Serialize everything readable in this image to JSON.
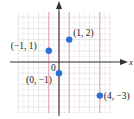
{
  "chart_data": {
    "type": "scatter",
    "title": "",
    "xlabel": "x",
    "ylabel": "",
    "origin_label": "0",
    "xlim": [
      -4,
      5
    ],
    "ylim": [
      -5,
      5
    ],
    "grid": true,
    "legend": null,
    "points": [
      {
        "x": -1,
        "y": 1,
        "label": "(−1, 1)"
      },
      {
        "x": 1,
        "y": 2,
        "label": "(1, 2)"
      },
      {
        "x": 0,
        "y": -1,
        "label": "(0, −1)"
      },
      {
        "x": 4,
        "y": -3,
        "label": "(4, −3)"
      }
    ],
    "highlight_vertical_lines_x": [
      -1,
      0,
      1,
      4
    ]
  },
  "colors": {
    "grid": "#d8d8d8",
    "highlight_line": "#e8a0ad",
    "axis": "#333333",
    "point": "#2a6fd6"
  }
}
